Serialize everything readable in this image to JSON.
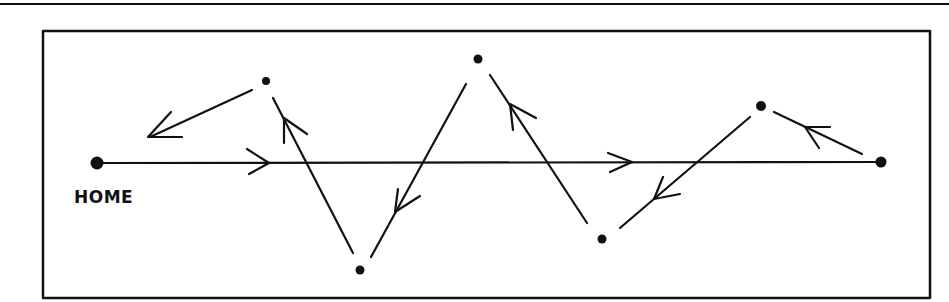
{
  "diagram": {
    "type": "path-route",
    "labels": {
      "home": "HOME"
    },
    "colors": {
      "ink": "#111111",
      "background": "#ffffff"
    },
    "nodes": [
      {
        "id": "home",
        "x": 97,
        "y": 163,
        "label": "HOME"
      },
      {
        "id": "p1",
        "x": 266,
        "y": 81
      },
      {
        "id": "p2",
        "x": 360,
        "y": 270
      },
      {
        "id": "p3",
        "x": 478,
        "y": 59
      },
      {
        "id": "p4",
        "x": 602,
        "y": 239
      },
      {
        "id": "p5",
        "x": 761,
        "y": 106
      },
      {
        "id": "end",
        "x": 880,
        "y": 162
      }
    ],
    "edges": [
      {
        "from": "home",
        "to": "end",
        "style": "straight direct path",
        "direction": "right"
      },
      {
        "from": "end",
        "to": "p5"
      },
      {
        "from": "p5",
        "to": "p4"
      },
      {
        "from": "p4",
        "to": "p3"
      },
      {
        "from": "p3",
        "to": "p2"
      },
      {
        "from": "p2",
        "to": "p1"
      },
      {
        "from": "p1",
        "to": "home-direction"
      }
    ]
  }
}
